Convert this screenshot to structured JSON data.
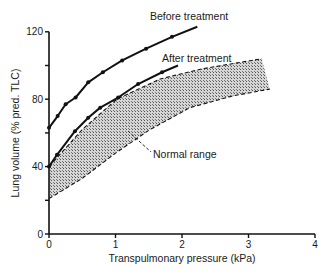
{
  "chart_data": {
    "type": "line",
    "title": "",
    "xlabel": "Transpulmonary pressure (kPa)",
    "ylabel": "Lung volume (% pred. TLC)",
    "xlim": [
      0,
      4
    ],
    "ylim": [
      0,
      120
    ],
    "x_ticks": [
      0,
      1,
      2,
      3,
      4
    ],
    "x_tick_labels": [
      "0",
      "1",
      "2",
      "3",
      "4"
    ],
    "y_ticks": [
      0,
      20,
      40,
      60,
      80,
      100,
      120
    ],
    "y_tick_labels": [
      "0",
      "",
      "40",
      "",
      "80",
      "",
      "120"
    ],
    "grid": false,
    "legend": "none (curves labeled directly)",
    "series": [
      {
        "name": "Before treatment",
        "style": "solid line with dot markers",
        "x": [
          0.0,
          0.13,
          0.25,
          0.4,
          0.59,
          0.81,
          1.1,
          1.46,
          1.85,
          2.23
        ],
        "y": [
          63,
          70,
          77,
          81,
          90,
          96,
          103,
          110,
          117,
          123
        ]
      },
      {
        "name": "After treatment",
        "style": "solid line with dot markers",
        "x": [
          0.0,
          0.12,
          0.39,
          0.59,
          0.77,
          1.04,
          1.34,
          1.7,
          1.94
        ],
        "y": [
          40,
          47,
          61,
          69,
          75,
          81,
          89,
          96,
          100
        ]
      },
      {
        "name": "Normal range upper bound",
        "style": "dashed",
        "x": [
          0.0,
          0.5,
          1.02,
          1.67,
          2.3,
          3.2
        ],
        "y": [
          40,
          62,
          80,
          92,
          98,
          104
        ]
      },
      {
        "name": "Normal range lower bound",
        "style": "dashed",
        "x": [
          0.0,
          0.5,
          1.0,
          1.52,
          2.12,
          2.77,
          3.32
        ],
        "y": [
          21,
          33,
          48,
          62,
          75,
          82,
          86
        ]
      }
    ],
    "shaded_region": {
      "name": "Normal range",
      "between": [
        "Normal range upper bound",
        "Normal range lower bound"
      ],
      "fill": "stippled grey"
    },
    "annotations": [
      {
        "text": "Before treatment",
        "near": [
          2.3,
          124
        ]
      },
      {
        "text": "After treatment",
        "near": [
          2.0,
          101
        ]
      },
      {
        "text": "Normal range",
        "near": [
          1.6,
          50
        ],
        "pointer_to": [
          1.2,
          62
        ]
      }
    ]
  },
  "labels": {
    "before": "Before treatment",
    "after": "After treatment",
    "normal": "Normal range",
    "xlabel": "Transpulmonary pressure (kPa)",
    "ylabel": "Lung volume (% pred. TLC)"
  },
  "colors": {
    "line": "#111111",
    "fill": "#9a9a9a",
    "text": "#1a1a1a"
  }
}
